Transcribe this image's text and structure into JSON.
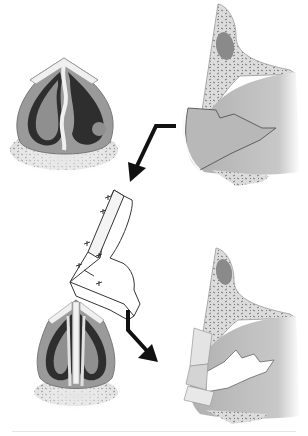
{
  "figure": {
    "panels": [
      {
        "id": "cross-section-before",
        "position": "top-left"
      },
      {
        "id": "lateral-view-before",
        "position": "top-right"
      },
      {
        "id": "graft",
        "position": "center"
      },
      {
        "id": "cross-section-after",
        "position": "bottom-left"
      },
      {
        "id": "lateral-view-after",
        "position": "bottom-right"
      }
    ],
    "arrows": [
      {
        "from": "lateral-view-before",
        "to": "graft"
      },
      {
        "from": "graft",
        "to": "lateral-view-after"
      }
    ],
    "colors": {
      "background": "#ffffff",
      "tissue": "#a8a8a8",
      "tissue_dark": "#2e2e2e",
      "cartilage": "#ececec",
      "bone": "#d9d9d9",
      "arrow": "#111111",
      "divider": "#e6e6e6"
    }
  }
}
